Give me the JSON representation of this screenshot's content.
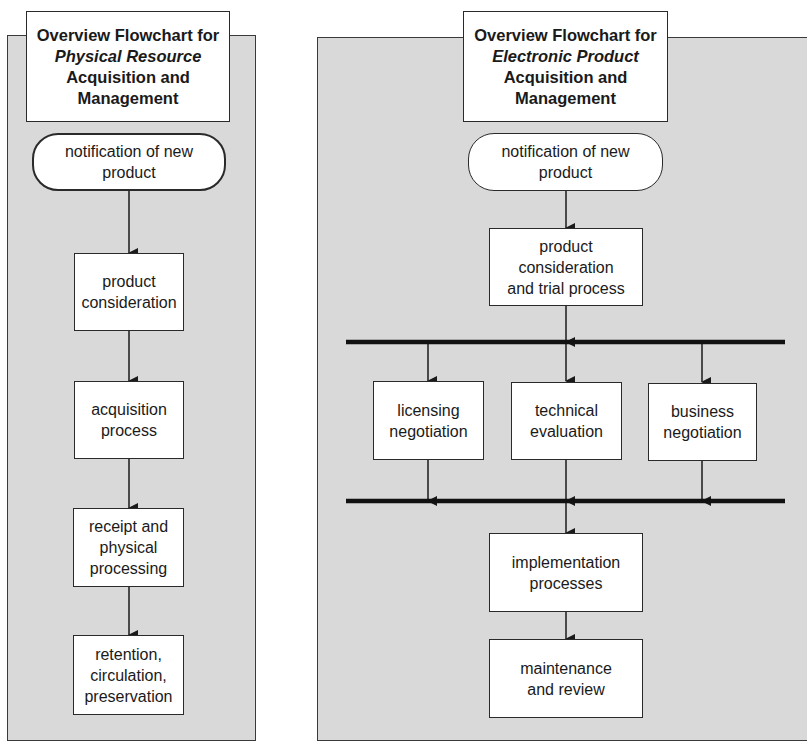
{
  "left_chart": {
    "title": {
      "line1": "Overview Flowchart for",
      "line2_italic": "Physical Resource",
      "line3": "Acquisition and",
      "line4": "Management"
    },
    "start": "notification of new\nproduct",
    "steps": [
      "product\nconsideration",
      "acquisition\nprocess",
      "receipt and\nphysical\nprocessing",
      "retention,\ncirculation,\npreservation"
    ]
  },
  "right_chart": {
    "title": {
      "line1": "Overview Flowchart for",
      "line2_italic": "Electronic Product",
      "line3": "Acquisition and",
      "line4": "Management"
    },
    "start": "notification of new\nproduct",
    "trial": "product\nconsideration\nand trial process",
    "parallel": [
      "licensing\nnegotiation",
      "technical\nevaluation",
      "business\nnegotiation"
    ],
    "implementation": "implementation\nprocesses",
    "maintenance": "maintenance\nand review"
  },
  "colors": {
    "panel_bg": "#d9d9d9",
    "box_bg": "#ffffff",
    "line": "#1a1a1a"
  }
}
